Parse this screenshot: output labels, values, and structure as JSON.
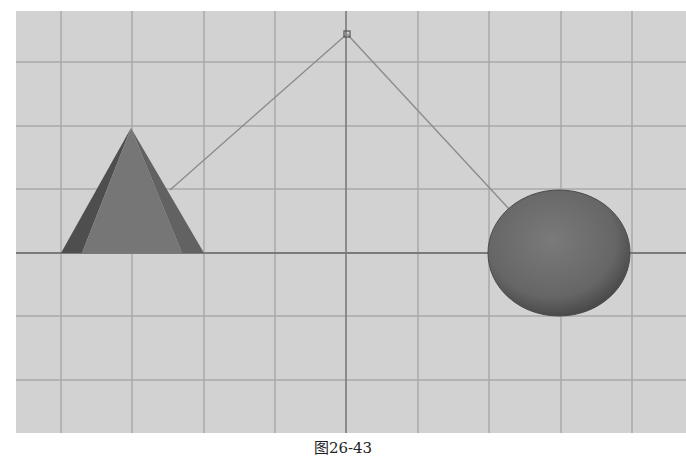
{
  "viewport": {
    "background": "#d2d2d2",
    "grid": {
      "color": "#a9a9a9",
      "axis_color": "#7a7a7a",
      "vertical_lines_x": [
        61,
        132,
        204,
        275,
        418,
        489,
        561,
        632
      ],
      "center_x": 346,
      "horizontal_lines_y": [
        62,
        126,
        189,
        316,
        380
      ],
      "horizon_y": 253
    },
    "objects": [
      {
        "name": "cone",
        "type": "cone",
        "apex": [
          131,
          128
        ],
        "base_left": [
          61,
          253
        ],
        "base_right": [
          204,
          253
        ],
        "color": "#6e6e6e"
      },
      {
        "name": "sphere",
        "type": "sphere",
        "center": [
          559,
          253
        ],
        "rx": 71,
        "ry": 63,
        "color": "#6a6a6a"
      },
      {
        "name": "light-point",
        "type": "locator",
        "position": [
          347,
          34
        ]
      }
    ],
    "lines": [
      {
        "from": [
          347,
          34
        ],
        "to": [
          170,
          190
        ]
      },
      {
        "from": [
          347,
          34
        ],
        "to": [
          510,
          210
        ]
      }
    ]
  },
  "caption": "图26-43"
}
